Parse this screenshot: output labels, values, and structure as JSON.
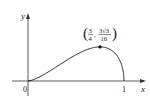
{
  "chart_data": {
    "type": "line",
    "title": "",
    "function": "y = x*sqrt(x - x^2)",
    "xlabel": "x",
    "ylabel": "y",
    "xlim": [
      0,
      1
    ],
    "x_ticks": [
      "0",
      "1"
    ],
    "grid": false,
    "series": [
      {
        "name": "curve",
        "x": [
          0,
          0.1,
          0.2,
          0.3,
          0.4,
          0.5,
          0.6,
          0.7,
          0.75,
          0.8,
          0.9,
          0.95,
          1.0
        ],
        "values": [
          0,
          0.03,
          0.08,
          0.1375,
          0.196,
          0.25,
          0.294,
          0.3208,
          0.3248,
          0.32,
          0.27,
          0.207,
          0
        ]
      }
    ],
    "annotations": [
      {
        "point": [
          0.75,
          0.3248
        ],
        "label_x_num": "3",
        "label_x_den": "4",
        "label_y_num": "3√3",
        "label_y_den": "16"
      }
    ]
  },
  "labels": {
    "origin": "0",
    "x_one": "1",
    "x_axis": "x",
    "y_axis": "y",
    "max_x_num": "3",
    "max_x_den": "4",
    "max_y_num": "3√3",
    "max_y_den": "16"
  }
}
